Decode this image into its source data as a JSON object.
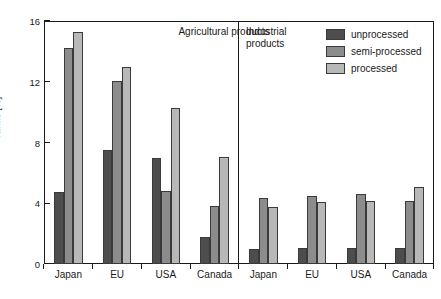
{
  "chart_data": {
    "type": "bar",
    "title": "",
    "subtitle": "",
    "xlabel": "",
    "ylabel": "Tariffs [%]",
    "ylim": [
      0,
      16
    ],
    "yticks": [
      0,
      4,
      8,
      12,
      16
    ],
    "ytick_labels": [
      "0",
      "4",
      "8",
      "12",
      "16"
    ],
    "grid": false,
    "legend_position": "top-right",
    "categories": [
      "Japan",
      "EU",
      "USA",
      "Canada",
      "Japan",
      "EU",
      "USA",
      "Canada"
    ],
    "groups": [
      {
        "name": "Agricultural products",
        "categories": [
          "Japan",
          "EU",
          "USA",
          "Canada"
        ]
      },
      {
        "name": "Industrial products",
        "categories": [
          "Japan",
          "EU",
          "USA",
          "Canada"
        ]
      }
    ],
    "series": [
      {
        "name": "unprocessed",
        "color": "#4d4d4d",
        "values": [
          4.75,
          7.5,
          7.0,
          1.8,
          1.0,
          1.05,
          1.05,
          1.05
        ]
      },
      {
        "name": "semi-processed",
        "color": "#8c8c8c",
        "values": [
          14.2,
          12.05,
          4.8,
          3.85,
          4.35,
          4.45,
          4.6,
          4.15
        ]
      },
      {
        "name": "processed",
        "color": "#b8b8b8",
        "values": [
          15.3,
          13.0,
          10.25,
          7.05,
          3.75,
          4.1,
          4.15,
          5.05
        ]
      }
    ],
    "section_labels": {
      "agricultural": "Agricultural products",
      "industrial": "Industrial\nproducts"
    },
    "axis_color": "#1a1a1a",
    "background_color": "#ffffff"
  }
}
